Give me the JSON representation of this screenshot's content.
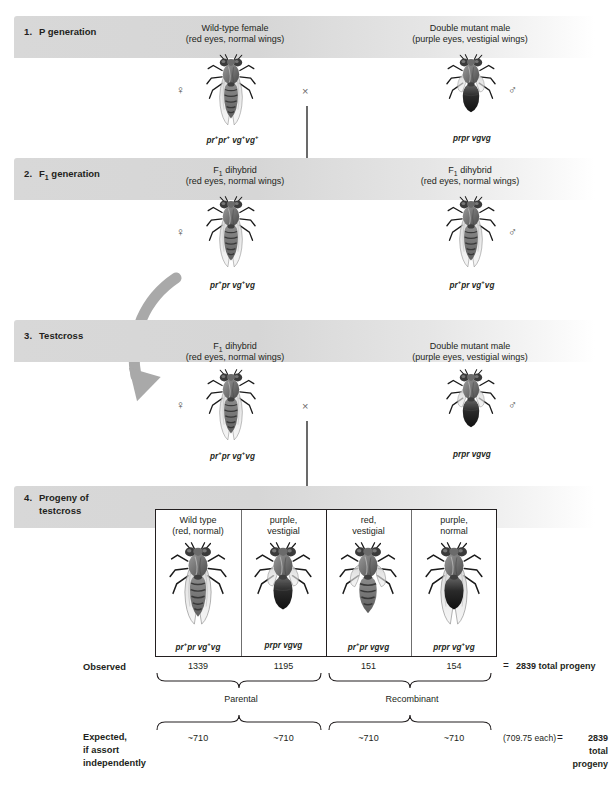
{
  "steps": [
    {
      "num": "1.",
      "title": "P generation",
      "left": {
        "caption_line1": "Wild-type female",
        "caption_line2": "(red eyes, normal wings)",
        "sex_symbol": "♀",
        "sex_name": "female-symbol",
        "genotype_html": "pr<sup>+</sup>pr<sup>+</sup> vg<sup>+</sup>vg<sup>+</sup>",
        "fly_type": "wildtype"
      },
      "right": {
        "caption_line1": "Double mutant male",
        "caption_line2": "(purple eyes, vestigial wings)",
        "sex_symbol": "♂",
        "sex_name": "male-symbol",
        "genotype_html": "prpr vgvg",
        "fly_type": "doublemutant"
      },
      "cross_symbol": "×"
    },
    {
      "num": "2.",
      "title_html": "F<sub>1</sub> generation",
      "left": {
        "caption_line1_html": "F<sub>1</sub> dihybrid",
        "caption_line2": "(red eyes, normal wings)",
        "sex_symbol": "♀",
        "sex_name": "female-symbol",
        "genotype_html": "pr<sup>+</sup>pr vg<sup>+</sup>vg",
        "fly_type": "dihybrid"
      },
      "right": {
        "caption_line1_html": "F<sub>1</sub> dihybrid",
        "caption_line2": "(red eyes, normal wings)",
        "sex_symbol": "♂",
        "sex_name": "male-symbol",
        "genotype_html": "pr<sup>+</sup>pr vg<sup>+</sup>vg",
        "fly_type": "dihybrid"
      }
    },
    {
      "num": "3.",
      "title": "Testcross",
      "left": {
        "caption_line1_html": "F<sub>1</sub> dihybrid",
        "caption_line2": "(red eyes, normal wings)",
        "sex_symbol": "♀",
        "sex_name": "female-symbol",
        "genotype_html": "pr<sup>+</sup>pr vg<sup>+</sup>vg",
        "fly_type": "dihybrid"
      },
      "right": {
        "caption_line1": "Double mutant male",
        "caption_line2": "(purple eyes, vestigial wings)",
        "sex_symbol": "♂",
        "sex_name": "male-symbol",
        "genotype_html": "prpr vgvg",
        "fly_type": "doublemutant"
      },
      "cross_symbol": "×"
    },
    {
      "num": "4.",
      "title_line1": "Progeny of",
      "title_line2": "testcross"
    }
  ],
  "progeny": {
    "columns": [
      {
        "phenotype_line1": "Wild type",
        "phenotype_line2": "(red, normal)",
        "genotype_html": "pr<sup>+</sup>pr vg<sup>+</sup>vg",
        "observed": "1339",
        "expected": "~710",
        "fly_type": "wildtype",
        "class": "parental"
      },
      {
        "phenotype_line1": "purple,",
        "phenotype_line2": "vestigial",
        "genotype_html": "prpr vgvg",
        "observed": "1195",
        "expected": "~710",
        "fly_type": "doublemutant",
        "class": "parental"
      },
      {
        "phenotype_line1": "red,",
        "phenotype_line2": "vestigial",
        "genotype_html": "pr<sup>+</sup>pr vgvg",
        "observed": "151",
        "expected": "~710",
        "fly_type": "redvestigial",
        "class": "recombinant"
      },
      {
        "phenotype_line1": "purple,",
        "phenotype_line2": "normal",
        "genotype_html": "prpr vg<sup>+</sup>vg",
        "observed": "154",
        "expected": "~710",
        "fly_type": "purplenormal",
        "class": "recombinant"
      }
    ]
  },
  "rows": {
    "observed_label": "Observed",
    "expected_label_line1": "Expected,",
    "expected_label_line2": "if assort",
    "expected_label_line3": "independently",
    "equals": "=",
    "observed_total": "2839 total progeny",
    "expected_each": "(709.75 each)",
    "expected_equals": "=",
    "expected_total_line1": "2839",
    "expected_total_line2": "total",
    "expected_total_line3": "progeny"
  },
  "brace_labels": {
    "parental": "Parental",
    "recombinant": "Recombinant"
  },
  "colors": {
    "text": "#231f20",
    "bar_start": "#d8d8d8",
    "bar_end": "#ffffff",
    "arrow": "#2b2b2b",
    "curved_arrow": "#a6a6a6",
    "box_border": "#231f20"
  }
}
